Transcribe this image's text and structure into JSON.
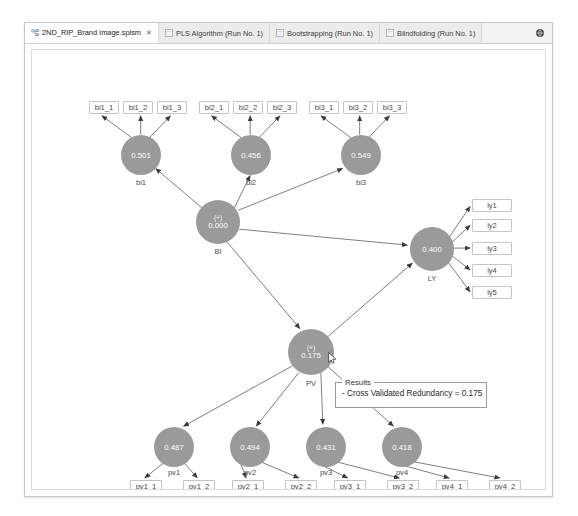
{
  "window": {
    "title_tabs": [
      {
        "label": "2ND_RIP_Brand Image.splsm",
        "icon": "model-file-icon",
        "active": true,
        "close": "✕"
      },
      {
        "label": "PLS Algorithm (Run No. 1)",
        "icon": "report-icon",
        "active": false
      },
      {
        "label": "Bootstrapping (Run No. 1)",
        "icon": "report-icon",
        "active": false
      },
      {
        "label": "Blindfolding (Run No. 1)",
        "icon": "report-icon",
        "active": false
      }
    ],
    "toolbar_icon": "globe-icon"
  },
  "diagram": {
    "type": "pls-sem-path-model",
    "node_color": "#9a9a9a",
    "indicators": [
      {
        "id": "bi1_1",
        "label": "bi1_1",
        "x": 57,
        "y": 51
      },
      {
        "id": "bi1_2",
        "label": "bi1_2",
        "x": 91,
        "y": 51
      },
      {
        "id": "bi1_3",
        "label": "bi1_3",
        "x": 125,
        "y": 51
      },
      {
        "id": "bi2_1",
        "label": "bi2_1",
        "x": 167,
        "y": 51
      },
      {
        "id": "bi2_2",
        "label": "bi2_2",
        "x": 201,
        "y": 51
      },
      {
        "id": "bi2_3",
        "label": "bi2_3",
        "x": 235,
        "y": 51
      },
      {
        "id": "bi3_1",
        "label": "bi3_1",
        "x": 277,
        "y": 51
      },
      {
        "id": "bi3_2",
        "label": "bi3_2",
        "x": 311,
        "y": 51
      },
      {
        "id": "bi3_3",
        "label": "bi3_3",
        "x": 345,
        "y": 51
      },
      {
        "id": "ly1",
        "label": "ly1",
        "x": 455,
        "y": 149
      },
      {
        "id": "ly2",
        "label": "ly2",
        "x": 455,
        "y": 171
      },
      {
        "id": "ly3",
        "label": "ly3",
        "x": 455,
        "y": 193
      },
      {
        "id": "ly4",
        "label": "ly4",
        "x": 455,
        "y": 215
      },
      {
        "id": "ly5",
        "label": "ly5",
        "x": 455,
        "y": 237
      },
      {
        "id": "pv1_1",
        "label": "pv1_1",
        "x": 100,
        "y": 437
      },
      {
        "id": "pv1_2",
        "label": "pv1_2",
        "x": 151,
        "y": 437
      },
      {
        "id": "pv2_1",
        "label": "pv2_1",
        "x": 202,
        "y": 437
      },
      {
        "id": "pv2_2",
        "label": "pv2_2",
        "x": 253,
        "y": 437
      },
      {
        "id": "pv3_1",
        "label": "pv3_1",
        "x": 304,
        "y": 437
      },
      {
        "id": "pv3_2",
        "label": "pv3_2",
        "x": 355,
        "y": 437
      },
      {
        "id": "pv4_1",
        "label": "pv4_1",
        "x": 406,
        "y": 437
      },
      {
        "id": "pv4_2",
        "label": "pv4_2",
        "x": 457,
        "y": 437
      }
    ],
    "latents": [
      {
        "id": "bi1",
        "label": "bi1",
        "value": "0.501",
        "plus": "",
        "cx": 109,
        "cy": 105,
        "r": 20
      },
      {
        "id": "bi2",
        "label": "bi2",
        "value": "0.456",
        "plus": "",
        "cx": 219,
        "cy": 105,
        "r": 20
      },
      {
        "id": "bi3",
        "label": "bi3",
        "value": "0.549",
        "plus": "",
        "cx": 329,
        "cy": 105,
        "r": 20
      },
      {
        "id": "BI",
        "label": "BI",
        "value": "0.000",
        "plus": "(+)",
        "cx": 186,
        "cy": 172,
        "r": 22
      },
      {
        "id": "LY",
        "label": "LY",
        "value": "0.400",
        "plus": "",
        "cx": 400,
        "cy": 199,
        "r": 22
      },
      {
        "id": "PV",
        "label": "PV",
        "value": "0.175",
        "plus": "(+)",
        "cx": 279,
        "cy": 302,
        "r": 23
      },
      {
        "id": "pv1",
        "label": "pv1",
        "value": "0.487",
        "plus": "",
        "cx": 142,
        "cy": 397,
        "r": 20
      },
      {
        "id": "pv2",
        "label": "pv2",
        "value": "0.494",
        "plus": "",
        "cx": 218,
        "cy": 397,
        "r": 20
      },
      {
        "id": "pv3",
        "label": "pv3",
        "value": "0.431",
        "plus": "",
        "cx": 294,
        "cy": 397,
        "r": 20
      },
      {
        "id": "pv4",
        "label": "pv4",
        "value": "0.418",
        "plus": "",
        "cx": 370,
        "cy": 397,
        "r": 20
      }
    ],
    "structural_paths": [
      {
        "from": "BI",
        "to": "LY"
      },
      {
        "from": "BI",
        "to": "PV"
      },
      {
        "from": "PV",
        "to": "LY"
      },
      {
        "from": "bi1",
        "to": "BI"
      },
      {
        "from": "bi2",
        "to": "BI"
      },
      {
        "from": "bi3",
        "to": "BI"
      },
      {
        "from": "PV",
        "to": "pv1"
      },
      {
        "from": "PV",
        "to": "pv2"
      },
      {
        "from": "PV",
        "to": "pv3"
      },
      {
        "from": "PV",
        "to": "pv4"
      }
    ]
  },
  "results_tooltip": {
    "legend": "Results",
    "line": "- Cross Validated Redundancy = 0.175"
  }
}
